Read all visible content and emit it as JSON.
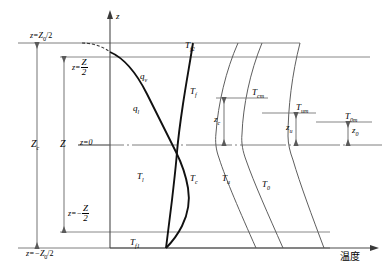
{
  "figure": {
    "type": "temperature-depth-profile-diagram",
    "axis": {
      "vertical_label": "z",
      "horizontal_label": "温度",
      "origin_label": "z=0"
    },
    "left_dimensions": [
      {
        "name": "z-top-outer",
        "label_main": "z=Z",
        "label_sub": "0",
        "label_tail": "/2"
      },
      {
        "name": "z-top-inner",
        "label_main": "z=",
        "frac_num": "Z",
        "frac_den": "2"
      },
      {
        "name": "z-bot-inner",
        "label_main": "z=−",
        "frac_num": "Z",
        "frac_den": "2"
      },
      {
        "name": "z-bot-outer",
        "label_main": "z=−Z",
        "label_sub": "0",
        "label_tail": "/2"
      }
    ],
    "span_labels": [
      {
        "name": "span-zc",
        "main": "Z",
        "sub": "c"
      },
      {
        "name": "span-z",
        "main": "Z",
        "sub": ""
      }
    ],
    "curve_labels": [
      {
        "name": "qv",
        "main": "q",
        "sub": "v",
        "x": 140,
        "y": 72
      },
      {
        "name": "ql",
        "main": "q",
        "sub": "l",
        "x": 133,
        "y": 104
      },
      {
        "name": "Tf",
        "main": "T",
        "sub": "f",
        "x": 190,
        "y": 87
      },
      {
        "name": "Tf2",
        "main": "T",
        "sub": "f2",
        "x": 185,
        "y": 41
      },
      {
        "name": "Tl",
        "main": "T",
        "sub": "l",
        "x": 137,
        "y": 172
      },
      {
        "name": "Tc",
        "main": "T",
        "sub": "c",
        "x": 190,
        "y": 174
      },
      {
        "name": "Tu",
        "main": "T",
        "sub": "u",
        "x": 222,
        "y": 174
      },
      {
        "name": "T0",
        "main": "T",
        "sub": "0",
        "x": 262,
        "y": 180
      },
      {
        "name": "Tf1",
        "main": "T",
        "sub": "f1",
        "x": 130,
        "y": 238
      }
    ],
    "right_markers": [
      {
        "name": "Tcm",
        "main": "T",
        "sub": "cm",
        "x": 252,
        "y": 93
      },
      {
        "name": "Tum",
        "main": "T",
        "sub": "um",
        "x": 296,
        "y": 104
      },
      {
        "name": "T0m",
        "main": "T",
        "sub": "0m",
        "x": 345,
        "y": 112
      }
    ],
    "offset_markers": [
      {
        "name": "zc-dim",
        "main": "z",
        "sub": "c",
        "x": 220,
        "y": 118
      },
      {
        "name": "zu-dim",
        "main": "z",
        "sub": "u",
        "x": 306,
        "y": 128
      },
      {
        "name": "z0-dim",
        "main": "z",
        "sub": "0",
        "x": 356,
        "y": 126
      }
    ],
    "colors": {
      "ink": "#000000",
      "thin": "#3a3a3a",
      "grid": "#8a8a8a"
    }
  }
}
